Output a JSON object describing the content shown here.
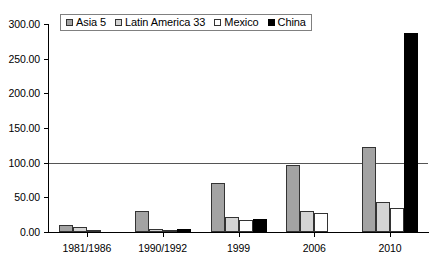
{
  "chart_data": {
    "type": "bar",
    "title": "",
    "subtitle": "",
    "xlabel": "",
    "ylabel": "",
    "categories": [
      "1981/1986",
      "1990/1992",
      "1999",
      "2006",
      "2010"
    ],
    "series": [
      {
        "name": "Asia 5",
        "color": "#a3a3a3",
        "values": [
          10,
          31,
          70,
          96,
          123
        ]
      },
      {
        "name": "Latin America 33",
        "color": "#d4d4d4",
        "values": [
          7,
          4,
          22,
          30,
          43
        ]
      },
      {
        "name": "Mexico",
        "color": "#ffffff",
        "values": [
          3,
          2,
          17,
          27,
          34
        ]
      },
      {
        "name": "China",
        "color": "#000000",
        "values": [
          0,
          5,
          19,
          0,
          287
        ]
      }
    ],
    "ylim": [
      0,
      300
    ],
    "ytick_values": [
      0,
      50,
      100,
      150,
      200,
      250,
      300
    ],
    "ytick_labels": [
      "0.00",
      "50.00",
      "100.00",
      "150.00",
      "200.00",
      "250.00",
      "300.00"
    ],
    "gridlines": [
      100
    ],
    "grid": true,
    "legend_position": "top",
    "legend_entries": [
      "Asia 5",
      "Latin America 33",
      "Mexico",
      "China"
    ]
  }
}
